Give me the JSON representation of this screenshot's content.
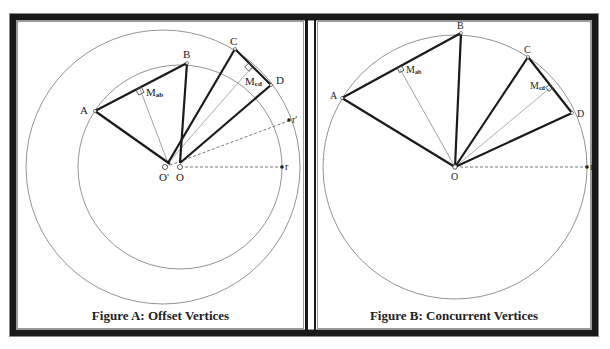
{
  "figures": [
    {
      "id": "A",
      "caption": "Figure A: Offset Vertices",
      "labels": {
        "A": "A",
        "B": "B",
        "C": "C",
        "D": "D",
        "Mab": "M",
        "Mab_sub": "ab",
        "Mcd": "M",
        "Mcd_sub": "cd",
        "O": "O",
        "Oprime": "O'",
        "r": "r",
        "rprime": "r'"
      }
    },
    {
      "id": "B",
      "caption": "Figure B: Concurrent Vertices",
      "labels": {
        "A": "A",
        "B": "B",
        "C": "C",
        "D": "D",
        "Mab": "M",
        "Mab_sub": "ab",
        "Mcd": "M",
        "Mcd_sub": "cd",
        "O": "O",
        "r": "r"
      }
    }
  ],
  "colors": {
    "frame": "#1a1a1a",
    "thick_line": "#1a1a1a",
    "thin_line": "#888888",
    "circle": "#777777"
  }
}
